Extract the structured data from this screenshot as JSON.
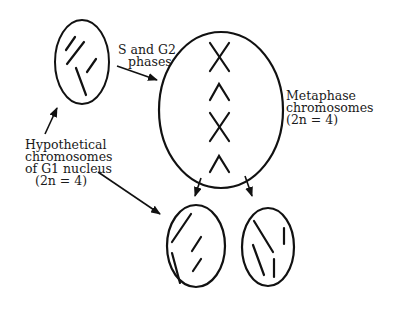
{
  "diagram": {
    "labels": {
      "s_g2": [
        "S and G2",
        "phases"
      ],
      "metaphase": [
        "Metaphase",
        "chromosomes",
        "(2n = 4)"
      ],
      "g1": [
        "Hypothetical",
        "chromosomes",
        "of G1 nucleus",
        "(2n = 4)"
      ]
    },
    "nodes": [
      {
        "id": "g1-nucleus",
        "description": "G1 nucleus with 4 single chromosomes"
      },
      {
        "id": "metaphase-cell",
        "description": "Cell with 4 duplicated metaphase chromosomes (X and ^ shapes)"
      },
      {
        "id": "daughter-left",
        "description": "Daughter nucleus with 4 chromosomes"
      },
      {
        "id": "daughter-right",
        "description": "Daughter nucleus with 4 chromosomes"
      }
    ],
    "colors": {
      "stroke": "#111111",
      "background": "#ffffff"
    }
  }
}
